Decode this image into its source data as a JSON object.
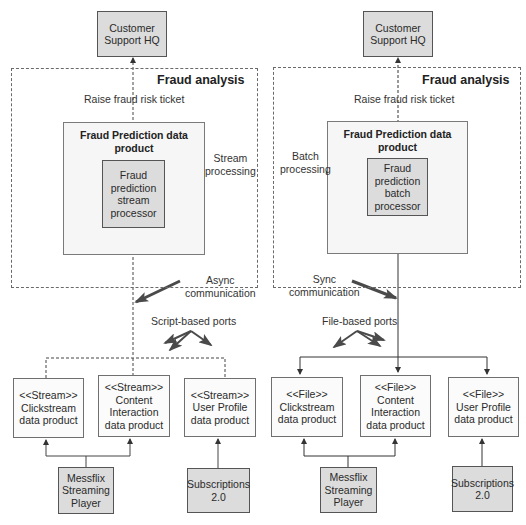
{
  "left": {
    "hq": "Customer\nSupport HQ",
    "frame_title": "Fraud analysis",
    "ticket_label": "Raise fraud risk ticket",
    "product_title": "Fraud Prediction data\nproduct",
    "processor": "Fraud\nprediction\nstream\nprocessor",
    "processing_label": "Stream\nprocessing",
    "communication_label": "Async\ncommunication",
    "ports_label": "Script-based ports",
    "sources": [
      {
        "label": "<<Stream>>\nClickstream\ndata product"
      },
      {
        "label": "<<Stream>>\nContent\nInteraction\ndata product"
      },
      {
        "label": "<<Stream>>\nUser Profile\ndata product"
      }
    ],
    "systems": [
      {
        "label": "Messflix\nStreaming\nPlayer"
      },
      {
        "label": "Subscriptions\n2.0"
      }
    ]
  },
  "right": {
    "hq": "Customer\nSupport HQ",
    "frame_title": "Fraud analysis",
    "ticket_label": "Raise fraud risk ticket",
    "product_title": "Fraud Prediction data\nproduct",
    "processor": "Fraud\nprediction\nbatch\nprocessor",
    "processing_label": "Batch\nprocessing",
    "communication_label": "Sync\ncommunication",
    "ports_label": "File-based ports",
    "sources": [
      {
        "label": "<<File>>\nClickstream\ndata product"
      },
      {
        "label": "<<File>>\nContent\nInteraction\ndata product"
      },
      {
        "label": "<<File>>\nUser Profile\ndata product"
      }
    ],
    "systems": [
      {
        "label": "Messflix\nStreaming\nPlayer"
      },
      {
        "label": "Subscriptions\n2.0"
      }
    ]
  },
  "colors": {
    "line": "#3a3a3a",
    "callout_arrow": "#4a4a4a",
    "gray_box": "#dcdcdc"
  }
}
